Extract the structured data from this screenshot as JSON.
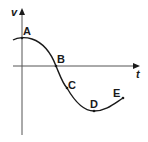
{
  "diagram": {
    "axes": {
      "y_label": "v",
      "x_label": "t"
    },
    "points": [
      {
        "label": "A",
        "description": "maximum positive velocity at t=0"
      },
      {
        "label": "B",
        "description": "velocity crosses zero"
      },
      {
        "label": "C",
        "description": "steepest negative slope"
      },
      {
        "label": "D",
        "description": "minimum (most negative) velocity"
      },
      {
        "label": "E",
        "description": "end of curve, velocity increasing"
      }
    ],
    "colors": {
      "ink": "#1a1a1a",
      "axis": "#555555",
      "background": "#ffffff"
    }
  }
}
